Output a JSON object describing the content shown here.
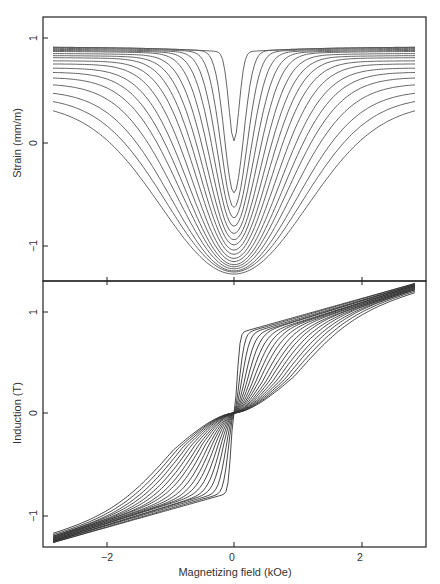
{
  "chart_data": [
    {
      "type": "line",
      "panel": "top",
      "title": "",
      "xlabel": "",
      "ylabel": "Strain (mm/m)",
      "xlim": [
        -3.0,
        3.0
      ],
      "ylim": [
        -1.35,
        1.22
      ],
      "xticks": [
        -2,
        0,
        2
      ],
      "xtick_labels": [
        "",
        "",
        ""
      ],
      "yticks": [
        1,
        0,
        -1
      ],
      "ytick_labels": [
        "1",
        "0",
        "−1"
      ],
      "grid": false,
      "legend": null,
      "description": "Family of ~18 symmetric butterfly magnetostriction curves vs. magnetizing field; each curve saturates at the edges and dips to a minimum at H=0",
      "x_range": [
        -2.84,
        2.84
      ],
      "series": [
        {
          "name": "curve 1",
          "sat": 0.92,
          "min": 0.02,
          "width": 0.12
        },
        {
          "name": "curve 2",
          "sat": 0.92,
          "min": -0.48,
          "width": 0.22
        },
        {
          "name": "curve 3",
          "sat": 0.91,
          "min": -0.62,
          "width": 0.3
        },
        {
          "name": "curve 4",
          "sat": 0.9,
          "min": -0.72,
          "width": 0.38
        },
        {
          "name": "curve 5",
          "sat": 0.89,
          "min": -0.8,
          "width": 0.46
        },
        {
          "name": "curve 6",
          "sat": 0.88,
          "min": -0.87,
          "width": 0.54
        },
        {
          "name": "curve 7",
          "sat": 0.86,
          "min": -0.93,
          "width": 0.62
        },
        {
          "name": "curve 8",
          "sat": 0.84,
          "min": -0.98,
          "width": 0.7
        },
        {
          "name": "curve 9",
          "sat": 0.82,
          "min": -1.03,
          "width": 0.78
        },
        {
          "name": "curve 10",
          "sat": 0.79,
          "min": -1.07,
          "width": 0.86
        },
        {
          "name": "curve 11",
          "sat": 0.76,
          "min": -1.11,
          "width": 0.95
        },
        {
          "name": "curve 12",
          "sat": 0.72,
          "min": -1.14,
          "width": 1.04
        },
        {
          "name": "curve 13",
          "sat": 0.68,
          "min": -1.17,
          "width": 1.13
        },
        {
          "name": "curve 14",
          "sat": 0.63,
          "min": -1.19,
          "width": 1.22
        },
        {
          "name": "curve 15",
          "sat": 0.57,
          "min": -1.21,
          "width": 1.32
        },
        {
          "name": "curve 16",
          "sat": 0.5,
          "min": -1.23,
          "width": 1.43
        },
        {
          "name": "curve 17",
          "sat": 0.44,
          "min": -1.24,
          "width": 1.55
        },
        {
          "name": "curve 18",
          "sat": 0.38,
          "min": -1.26,
          "width": 1.68
        }
      ]
    },
    {
      "type": "line",
      "panel": "bottom",
      "title": "",
      "xlabel": "Magnetizing field (kOe)",
      "ylabel": "Induction (T)",
      "xlim": [
        -3.0,
        3.0
      ],
      "ylim": [
        -1.33,
        1.31
      ],
      "xticks": [
        -2,
        0,
        2
      ],
      "xtick_labels": [
        "−2",
        "0",
        "2"
      ],
      "yticks": [
        1,
        0,
        -1
      ],
      "ytick_labels": [
        "1",
        "0",
        "−1"
      ],
      "grid": false,
      "legend": null,
      "description": "Family of ~18 anti-symmetric B-H magnetization curves passing through the origin; steepness near H=0 decreases across the family; B reaches about ±1.2–1.27 T at H=±2.84 kOe",
      "x_range": [
        -2.84,
        2.84
      ],
      "series": [
        {
          "name": "curve 1",
          "knee": 0.08,
          "b_knee": 0.78,
          "b_end": 1.27
        },
        {
          "name": "curve 2",
          "knee": 0.14,
          "b_knee": 0.77,
          "b_end": 1.27
        },
        {
          "name": "curve 3",
          "knee": 0.2,
          "b_knee": 0.76,
          "b_end": 1.26
        },
        {
          "name": "curve 4",
          "knee": 0.27,
          "b_knee": 0.75,
          "b_end": 1.26
        },
        {
          "name": "curve 5",
          "knee": 0.34,
          "b_knee": 0.75,
          "b_end": 1.26
        },
        {
          "name": "curve 6",
          "knee": 0.41,
          "b_knee": 0.74,
          "b_end": 1.25
        },
        {
          "name": "curve 7",
          "knee": 0.49,
          "b_knee": 0.74,
          "b_end": 1.25
        },
        {
          "name": "curve 8",
          "knee": 0.57,
          "b_knee": 0.74,
          "b_end": 1.25
        },
        {
          "name": "curve 9",
          "knee": 0.65,
          "b_knee": 0.74,
          "b_end": 1.24
        },
        {
          "name": "curve 10",
          "knee": 0.74,
          "b_knee": 0.74,
          "b_end": 1.24
        },
        {
          "name": "curve 11",
          "knee": 0.83,
          "b_knee": 0.74,
          "b_end": 1.23
        },
        {
          "name": "curve 12",
          "knee": 0.92,
          "b_knee": 0.75,
          "b_end": 1.23
        },
        {
          "name": "curve 13",
          "knee": 1.02,
          "b_knee": 0.76,
          "b_end": 1.22
        },
        {
          "name": "curve 14",
          "knee": 1.12,
          "b_knee": 0.77,
          "b_end": 1.22
        },
        {
          "name": "curve 15",
          "knee": 1.23,
          "b_knee": 0.79,
          "b_end": 1.21
        },
        {
          "name": "curve 16",
          "knee": 1.34,
          "b_knee": 0.81,
          "b_end": 1.21
        },
        {
          "name": "curve 17",
          "knee": 1.46,
          "b_knee": 0.84,
          "b_end": 1.2
        },
        {
          "name": "curve 18",
          "knee": 1.58,
          "b_knee": 0.87,
          "b_end": 1.19
        }
      ]
    }
  ],
  "axes": {
    "top_ylabel": "Strain (mm/m)",
    "bottom_ylabel": "Induction (T)",
    "xlabel": "Magnetizing field (kOe)",
    "top_yticks": [
      "1",
      "0",
      "−1"
    ],
    "bottom_yticks": [
      "1",
      "0",
      "−1"
    ],
    "xticks": [
      "−2",
      "0",
      "2"
    ]
  },
  "colors": {
    "curve": "#555555",
    "curve_bottom": "#333333",
    "frame": "#222222",
    "background": "#ffffff"
  }
}
